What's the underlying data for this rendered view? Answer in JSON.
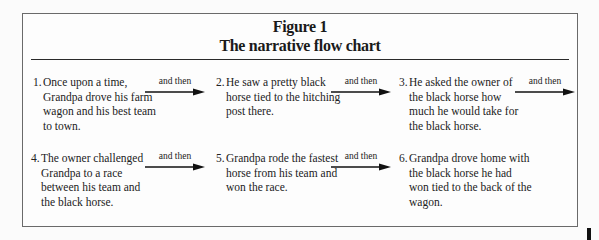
{
  "figure": {
    "label": "Figure 1",
    "title": "The narrative flow chart"
  },
  "connector_label": "and then",
  "steps": [
    {
      "number": "1.",
      "text": "Once upon a time, Grandpa drove his farm wagon and his best team to town."
    },
    {
      "number": "2.",
      "text": "He saw a pretty black horse tied to the hitching post there."
    },
    {
      "number": "3.",
      "text": "He asked the owner of the black horse how much he would take for the black horse."
    },
    {
      "number": "4.",
      "text": "The owner challenged Grandpa to a race between his team and the black horse."
    },
    {
      "number": "5.",
      "text": "Grandpa rode the fastest horse from his team and won the race."
    },
    {
      "number": "6.",
      "text": "Grandpa drove home with the black horse he had won tied to the back of the wagon."
    }
  ],
  "arrows": [
    {
      "from": 1,
      "to": 2,
      "label": "and then"
    },
    {
      "from": 2,
      "to": 3,
      "label": "and then"
    },
    {
      "from": 3,
      "to": 4,
      "label": "and then"
    },
    {
      "from": 4,
      "to": 5,
      "label": "and then"
    },
    {
      "from": 5,
      "to": 6,
      "label": "and then"
    }
  ],
  "colors": {
    "border": "#6a6a6a",
    "text": "#1e1e1e",
    "arrow": "#111111"
  }
}
